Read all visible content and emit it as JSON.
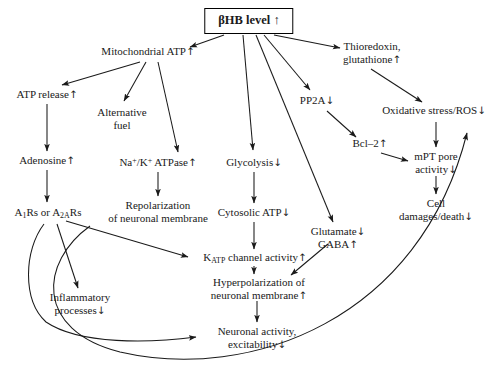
{
  "figure": {
    "title_node": {
      "label": "βHB level ↑",
      "id": "bhb-level"
    },
    "nodes": [
      {
        "id": "mitochondrial-atp",
        "label": "Mitochondrial ATP↑",
        "x": 148,
        "y": 52
      },
      {
        "id": "thioredoxin-glutathione",
        "label": "Thioredoxin,\nglutathione↑",
        "x": 372,
        "y": 47
      },
      {
        "id": "atp-release",
        "label": "ATP release↑",
        "x": 47,
        "y": 95
      },
      {
        "id": "alternative-fuel",
        "label": "Alternative\nfuel",
        "x": 122,
        "y": 113
      },
      {
        "id": "pp2a",
        "label": "PP2A↓",
        "x": 317,
        "y": 101
      },
      {
        "id": "oxidative-stress-ros",
        "label": "Oxidative stress/ROS↓",
        "x": 434,
        "y": 111
      },
      {
        "id": "adenosine",
        "label": "Adenosine↑",
        "x": 47,
        "y": 161
      },
      {
        "id": "na-k-atpase",
        "label": "Na<sup>+</sup>/K<sup>+</sup> ATPase↑",
        "x": 158,
        "y": 163
      },
      {
        "id": "glycolysis",
        "label": "Glycolysis↓",
        "x": 254,
        "y": 163
      },
      {
        "id": "bcl-2",
        "label": "Bcl–2↑",
        "x": 370,
        "y": 144
      },
      {
        "id": "mpt-pore-activity",
        "label": "mPT pore\nactivity↓",
        "x": 436,
        "y": 157
      },
      {
        "id": "a1rs-a2ars",
        "label": "A<sub>1</sub>Rs or A<sub>2A</sub>Rs",
        "x": 48,
        "y": 213
      },
      {
        "id": "repolarization",
        "label": "Repolarization\nof neuronal membrane",
        "x": 158,
        "y": 206
      },
      {
        "id": "cytosolic-atp",
        "label": "Cytosolic ATP↓",
        "x": 254,
        "y": 213
      },
      {
        "id": "cell-damages-death",
        "label": "Cell\ndamages/death↓",
        "x": 436,
        "y": 204
      },
      {
        "id": "glutamate-gaba",
        "label": "Glutamate↓\nGABA↑",
        "x": 338,
        "y": 232
      },
      {
        "id": "katp-channel-activity",
        "label": "K<sub>ATP</sub> channel activity↑",
        "x": 255,
        "y": 258
      },
      {
        "id": "inflammatory-processes",
        "label": "Inflammatory\nprocesses↓",
        "x": 80,
        "y": 298
      },
      {
        "id": "hyperpolarization",
        "label": "Hyperpolarization of\nneuronal membrane↑",
        "x": 259,
        "y": 283
      },
      {
        "id": "neuronal-activity",
        "label": "Neuronal activity,\nexcitability↓",
        "x": 257,
        "y": 332
      }
    ],
    "edges": [
      {
        "id": "bhb-to-mitochondrial-atp",
        "from": "bhb-level",
        "to": "mitochondrial-atp"
      },
      {
        "id": "bhb-to-thioredoxin",
        "from": "bhb-level",
        "to": "thioredoxin-glutathione"
      },
      {
        "id": "bhb-to-pp2a",
        "from": "bhb-level",
        "to": "pp2a"
      },
      {
        "id": "bhb-to-glycolysis",
        "from": "bhb-level",
        "to": "glycolysis"
      },
      {
        "id": "bhb-to-glutamate-gaba",
        "from": "bhb-level",
        "to": "glutamate-gaba"
      },
      {
        "id": "mito-atp-to-atp-release",
        "from": "mitochondrial-atp",
        "to": "atp-release"
      },
      {
        "id": "mito-atp-to-alternative-fuel",
        "from": "mitochondrial-atp",
        "to": "alternative-fuel"
      },
      {
        "id": "mito-atp-to-na-k-atpase",
        "from": "mitochondrial-atp",
        "to": "na-k-atpase"
      },
      {
        "id": "atp-release-to-adenosine",
        "from": "atp-release",
        "to": "adenosine"
      },
      {
        "id": "adenosine-to-a1rs",
        "from": "adenosine",
        "to": "a1rs-a2ars"
      },
      {
        "id": "na-k-atpase-to-repolarization",
        "from": "na-k-atpase",
        "to": "repolarization"
      },
      {
        "id": "glycolysis-to-cytosolic-atp",
        "from": "glycolysis",
        "to": "cytosolic-atp"
      },
      {
        "id": "cytosolic-atp-to-katp",
        "from": "cytosolic-atp",
        "to": "katp-channel-activity"
      },
      {
        "id": "a1rs-to-katp",
        "from": "a1rs-a2ars",
        "to": "katp-channel-activity"
      },
      {
        "id": "a1rs-to-inflammatory",
        "from": "a1rs-a2ars",
        "to": "inflammatory-processes"
      },
      {
        "id": "a1rs-to-neuronal-activity",
        "from": "a1rs-a2ars",
        "to": "neuronal-activity"
      },
      {
        "id": "a1rs-to-oxidative-stress",
        "from": "a1rs-a2ars",
        "to": "oxidative-stress-ros"
      },
      {
        "id": "katp-to-hyperpolarization",
        "from": "katp-channel-activity",
        "to": "hyperpolarization"
      },
      {
        "id": "glutamate-to-hyperpolarization",
        "from": "glutamate-gaba",
        "to": "hyperpolarization"
      },
      {
        "id": "hyperpol-to-neuronal-activity",
        "from": "hyperpolarization",
        "to": "neuronal-activity"
      },
      {
        "id": "thioredoxin-to-oxidative",
        "from": "thioredoxin-glutathione",
        "to": "oxidative-stress-ros"
      },
      {
        "id": "pp2a-to-bcl-2",
        "from": "pp2a",
        "to": "bcl-2"
      },
      {
        "id": "bcl-2-to-mpt-pore",
        "from": "bcl-2",
        "to": "mpt-pore-activity"
      },
      {
        "id": "oxidative-to-mpt-pore",
        "from": "oxidative-stress-ros",
        "to": "mpt-pore-activity"
      },
      {
        "id": "mpt-pore-to-cell-damages",
        "from": "mpt-pore-activity",
        "to": "cell-damages-death"
      }
    ],
    "colors": {
      "stroke": "#1a1a1a",
      "text": "#1a1a1a",
      "background": "#ffffff"
    }
  }
}
